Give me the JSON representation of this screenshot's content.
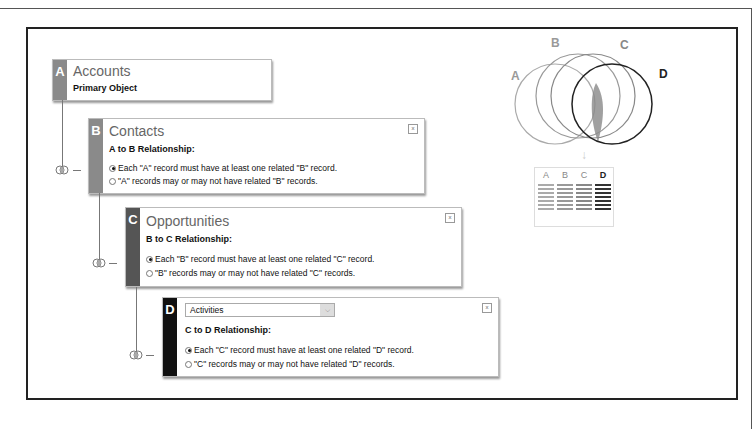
{
  "cards": [
    {
      "letter": "A",
      "title": "Accounts",
      "subtitle": "Primary Object",
      "bar_color": "#8a8a8a"
    },
    {
      "letter": "B",
      "title": "Contacts",
      "subtitle": "A to B Relationship:",
      "bar_color": "#8a8a8a",
      "options": [
        "Each \"A\" record must have at least one related \"B\" record.",
        "\"A\" records may or may not have related \"B\" records."
      ],
      "selected": 0,
      "close": "x"
    },
    {
      "letter": "C",
      "title": "Opportunities",
      "subtitle": "B to C Relationship:",
      "bar_color": "#555555",
      "options": [
        "Each \"B\" record must have at least one related \"C\" record.",
        "\"B\" records may or may not have related \"C\" records."
      ],
      "selected": 0,
      "close": "x"
    },
    {
      "letter": "D",
      "select_value": "Activities",
      "subtitle": "C to D Relationship:",
      "bar_color": "#111111",
      "options": [
        "Each \"C\" record must have at least one related \"D\" record.",
        "\"C\" records may or may not have related \"D\" records."
      ],
      "selected": 0,
      "close": "x"
    }
  ],
  "venn": {
    "labels": [
      "A",
      "B",
      "C",
      "D"
    ],
    "colors": [
      "#999999",
      "#999999",
      "#888888",
      "#222222"
    ],
    "arrow": "↓"
  },
  "table": {
    "headers": [
      "A",
      "B",
      "C",
      "D"
    ],
    "line_colors": [
      "#aaaaaa",
      "#999999",
      "#888888",
      "#333333"
    ],
    "rows": 7
  }
}
